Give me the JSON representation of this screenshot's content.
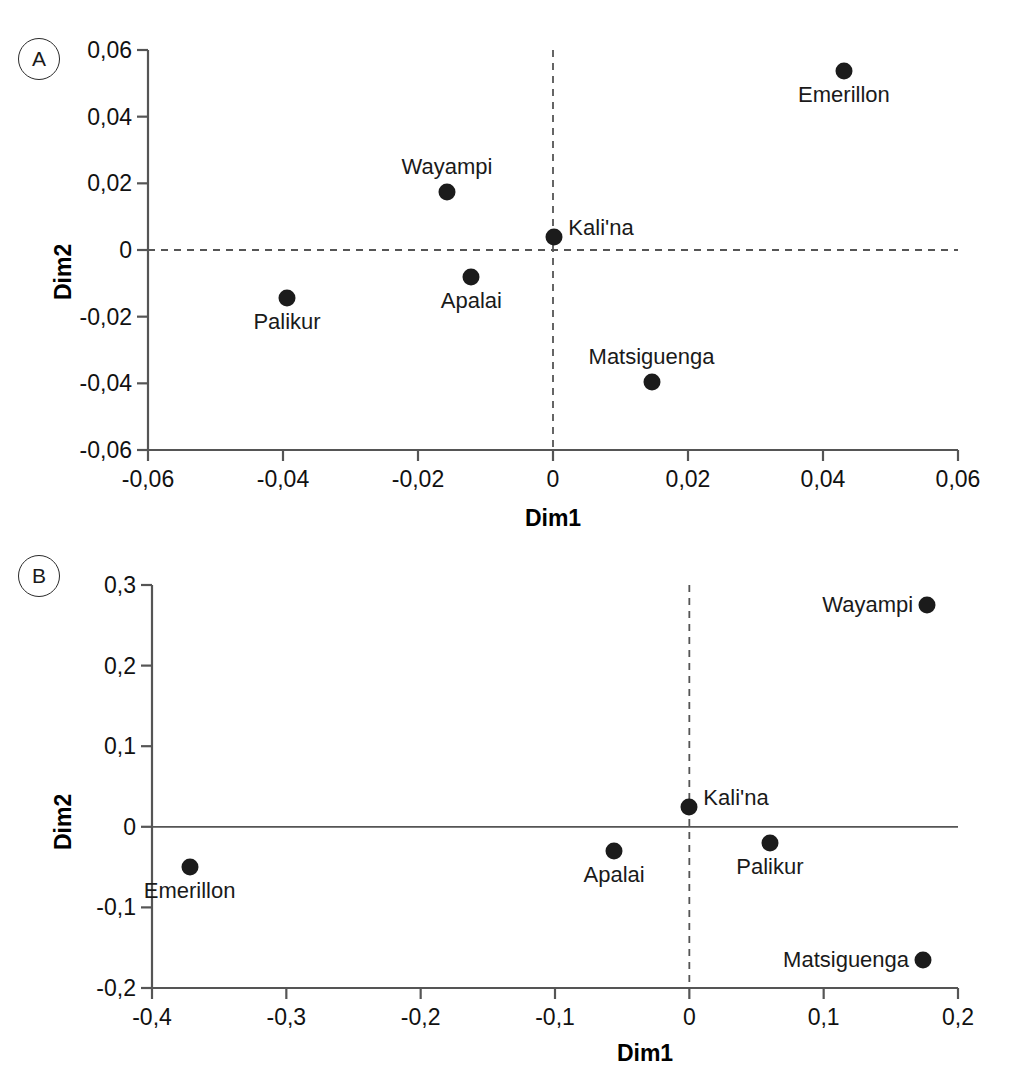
{
  "figure": {
    "panels": [
      {
        "id": "A",
        "badge": "A",
        "xlabel": "Dim1",
        "ylabel": "Dim2"
      },
      {
        "id": "B",
        "badge": "B",
        "xlabel": "Dim1",
        "ylabel": "Dim2"
      }
    ]
  },
  "chart_data": [
    {
      "type": "scatter",
      "panel": "A",
      "title": "",
      "xlabel": "Dim1",
      "ylabel": "Dim2",
      "xlim": [
        -0.06,
        0.06
      ],
      "ylim": [
        -0.06,
        0.06
      ],
      "xticks": [
        -0.06,
        -0.04,
        -0.02,
        0,
        0.02,
        0.04,
        0.06
      ],
      "yticks": [
        -0.06,
        -0.04,
        -0.02,
        0,
        0.02,
        0.04,
        0.06
      ],
      "xticklabels": [
        "-0,06",
        "-0,04",
        "-0,02",
        "0",
        "0,02",
        "0,04",
        "0,06"
      ],
      "yticklabels": [
        "-0,06",
        "-0,04",
        "-0,02",
        "0",
        "0,02",
        "0,04",
        "0,06"
      ],
      "grid": false,
      "legend": "none",
      "reference_lines": [
        {
          "orientation": "horizontal",
          "value": 0,
          "style": "dashed"
        },
        {
          "orientation": "vertical",
          "value": 0,
          "style": "dashed"
        }
      ],
      "points": [
        {
          "label": "Emerillon",
          "x": 0.0431,
          "y": 0.0537,
          "label_pos": "below"
        },
        {
          "label": "Wayampi",
          "x": -0.0157,
          "y": 0.0175,
          "label_pos": "above"
        },
        {
          "label": "Kali'na",
          "x": 0.0002,
          "y": 0.004,
          "label_pos": "right"
        },
        {
          "label": "Apalai",
          "x": -0.0121,
          "y": -0.008,
          "label_pos": "below"
        },
        {
          "label": "Palikur",
          "x": -0.0394,
          "y": -0.0143,
          "label_pos": "below"
        },
        {
          "label": "Matsiguenga",
          "x": 0.0146,
          "y": -0.0395,
          "label_pos": "above"
        }
      ]
    },
    {
      "type": "scatter",
      "panel": "B",
      "title": "",
      "xlabel": "Dim1",
      "ylabel": "Dim2",
      "xlim": [
        -0.4,
        0.2
      ],
      "ylim": [
        -0.2,
        0.3
      ],
      "xticks": [
        -0.4,
        -0.3,
        -0.2,
        -0.1,
        0,
        0.1,
        0.2
      ],
      "yticks": [
        -0.2,
        -0.1,
        0,
        0.1,
        0.2,
        0.3
      ],
      "xticklabels": [
        "-0,4",
        "-0,3",
        "-0,2",
        "-0,1",
        "0",
        "0,1",
        "0,2"
      ],
      "yticklabels": [
        "-0,2",
        "-0,1",
        "0",
        "0,1",
        "0,2",
        "0,3"
      ],
      "grid": false,
      "legend": "none",
      "reference_lines": [
        {
          "orientation": "horizontal",
          "value": 0,
          "style": "solid"
        },
        {
          "orientation": "vertical",
          "value": 0,
          "style": "dashed"
        }
      ],
      "points": [
        {
          "label": "Wayampi",
          "x": 0.177,
          "y": 0.275,
          "label_pos": "left"
        },
        {
          "label": "Kali'na",
          "x": 0.0,
          "y": 0.025,
          "label_pos": "right"
        },
        {
          "label": "Palikur",
          "x": 0.06,
          "y": -0.02,
          "label_pos": "below"
        },
        {
          "label": "Apalai",
          "x": -0.056,
          "y": -0.03,
          "label_pos": "below"
        },
        {
          "label": "Emerillon",
          "x": -0.372,
          "y": -0.05,
          "label_pos": "below"
        },
        {
          "label": "Matsiguenga",
          "x": 0.174,
          "y": -0.165,
          "label_pos": "left"
        }
      ]
    }
  ],
  "colors": {
    "point": "#1b1b1b",
    "axis": "#555555",
    "text": "#1a1a1a",
    "background": "#ffffff"
  }
}
